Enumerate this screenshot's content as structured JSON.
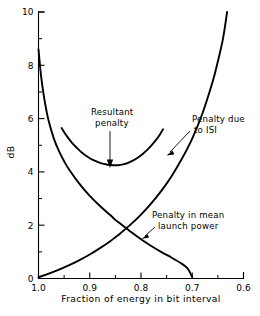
{
  "chart_data": {
    "type": "line",
    "title": "",
    "xlabel": "Fraction of energy in bit interval",
    "ylabel": "dB",
    "xlim": [
      1.0,
      0.6
    ],
    "ylim": [
      0,
      10
    ],
    "x_ticks": [
      "1.0",
      "0.9",
      "0.8",
      "0.7",
      "0.6"
    ],
    "x_tick_values": [
      1.0,
      0.9,
      0.8,
      0.7,
      0.6
    ],
    "x_minor_step": 0.05,
    "y_ticks": [
      "0",
      "2",
      "4",
      "6",
      "8",
      "10"
    ],
    "y_tick_values": [
      0,
      2,
      4,
      6,
      8,
      10
    ],
    "y_minor_step": 1,
    "grid": false,
    "legend_position": "inline-annotations",
    "series": [
      {
        "name": "Penalty due to ISI",
        "points": [
          [
            1.0,
            0.05
          ],
          [
            0.98,
            0.18
          ],
          [
            0.96,
            0.33
          ],
          [
            0.94,
            0.5
          ],
          [
            0.92,
            0.69
          ],
          [
            0.9,
            0.9
          ],
          [
            0.88,
            1.14
          ],
          [
            0.86,
            1.4
          ],
          [
            0.85,
            1.55
          ],
          [
            0.84,
            1.7
          ],
          [
            0.82,
            2.03
          ],
          [
            0.8,
            2.4
          ],
          [
            0.78,
            2.82
          ],
          [
            0.76,
            3.3
          ],
          [
            0.74,
            3.85
          ],
          [
            0.72,
            4.5
          ],
          [
            0.7,
            5.25
          ],
          [
            0.68,
            6.2
          ],
          [
            0.66,
            7.4
          ],
          [
            0.65,
            8.15
          ],
          [
            0.64,
            9.0
          ],
          [
            0.632,
            10.0
          ]
        ]
      },
      {
        "name": "Penalty in mean launch power",
        "points": [
          [
            1.0,
            8.6
          ],
          [
            0.995,
            7.6
          ],
          [
            0.99,
            6.9
          ],
          [
            0.985,
            6.35
          ],
          [
            0.98,
            5.9
          ],
          [
            0.97,
            5.25
          ],
          [
            0.96,
            4.78
          ],
          [
            0.95,
            4.4
          ],
          [
            0.94,
            4.08
          ],
          [
            0.92,
            3.55
          ],
          [
            0.9,
            3.1
          ],
          [
            0.88,
            2.72
          ],
          [
            0.86,
            2.38
          ],
          [
            0.85,
            2.2
          ],
          [
            0.84,
            2.05
          ],
          [
            0.82,
            1.75
          ],
          [
            0.8,
            1.47
          ],
          [
            0.78,
            1.22
          ],
          [
            0.76,
            0.99
          ],
          [
            0.74,
            0.78
          ],
          [
            0.72,
            0.55
          ],
          [
            0.71,
            0.4
          ],
          [
            0.705,
            0.25
          ],
          [
            0.7,
            0.05
          ]
        ]
      },
      {
        "name": "Resultant penalty",
        "points": [
          [
            0.955,
            5.65
          ],
          [
            0.945,
            5.35
          ],
          [
            0.935,
            5.1
          ],
          [
            0.925,
            4.9
          ],
          [
            0.915,
            4.72
          ],
          [
            0.905,
            4.58
          ],
          [
            0.895,
            4.46
          ],
          [
            0.885,
            4.38
          ],
          [
            0.875,
            4.31
          ],
          [
            0.865,
            4.27
          ],
          [
            0.855,
            4.25
          ],
          [
            0.845,
            4.25
          ],
          [
            0.835,
            4.28
          ],
          [
            0.825,
            4.34
          ],
          [
            0.815,
            4.43
          ],
          [
            0.805,
            4.55
          ],
          [
            0.795,
            4.7
          ],
          [
            0.785,
            4.88
          ],
          [
            0.775,
            5.1
          ],
          [
            0.765,
            5.35
          ],
          [
            0.757,
            5.6
          ]
        ]
      }
    ],
    "annotations": [
      {
        "id": "resultant-penalty",
        "text_lines": [
          "Resultant",
          "penalty"
        ],
        "target": [
          0.872,
          4.32
        ],
        "marker": "arrow"
      },
      {
        "id": "penalty-due-to-isi",
        "text_lines": [
          "Penalty due",
          "to ISI"
        ],
        "target": [
          0.772,
          4.45
        ],
        "marker": "leader-line"
      },
      {
        "id": "penalty-in-mean-launch-power",
        "text_lines": [
          "Penalty in mean",
          "launch power"
        ],
        "target": [
          0.788,
          1.28
        ],
        "marker": "leader-line"
      }
    ]
  }
}
